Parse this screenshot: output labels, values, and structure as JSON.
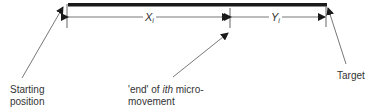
{
  "diagram": {
    "bar": {
      "x1": 68,
      "x2": 327,
      "y": 4.5,
      "thickness": 3.5,
      "color": "#1a1a1a"
    },
    "ticks": [
      {
        "name": "start-tick",
        "x": 67,
        "y1": 4,
        "y2": 28
      },
      {
        "name": "mid-tick",
        "x": 230,
        "y1": 8,
        "y2": 28
      },
      {
        "name": "end-tick",
        "x": 326,
        "y1": 6,
        "y2": 27
      }
    ],
    "dimensions": [
      {
        "name": "x-dimension",
        "from": 68,
        "to": 229,
        "y": 17,
        "label": "X",
        "subscript": "i"
      },
      {
        "name": "y-dimension",
        "from": 231,
        "to": 325,
        "y": 17,
        "label": "Y",
        "subscript": "i"
      }
    ],
    "leaders": [
      {
        "name": "starting-position-leader",
        "from": [
          22,
          78
        ],
        "to": [
          63,
          7
        ]
      },
      {
        "name": "ith-end-leader",
        "from": [
          173,
          77
        ],
        "to": [
          228,
          33
        ]
      },
      {
        "name": "target-leader",
        "from": [
          346,
          64
        ],
        "to": [
          328,
          8
        ]
      }
    ],
    "labels": {
      "starting_line1": "Starting",
      "starting_line2": "position",
      "end_quote": "'end' of ",
      "end_ith": "ith",
      "end_rest": " micro-",
      "end_line2": "movement",
      "target": "Target"
    },
    "x_label": "X",
    "x_sub": "i",
    "y_label": "Y",
    "y_sub": "i",
    "line_color": "#555555"
  }
}
